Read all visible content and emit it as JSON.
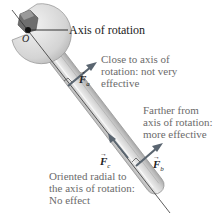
{
  "labels": {
    "axis": "Axis of rotation",
    "origin": "O",
    "close": [
      "Close to axis of",
      "rotation: not very",
      "effective"
    ],
    "farther": [
      "Farther from",
      "axis of rotation:",
      "more effective"
    ],
    "radial": [
      "Oriented radial to",
      "the axis of rotation:",
      "No effect"
    ]
  },
  "forces": {
    "a": {
      "symbol": "F",
      "sub": "a",
      "arrow": "→"
    },
    "b": {
      "symbol": "F",
      "sub": "b",
      "arrow": "→"
    },
    "c": {
      "symbol": "F",
      "sub": "c",
      "arrow": "→"
    }
  },
  "colors": {
    "wrench_light": "#e6e6e6",
    "wrench_mid": "#c8c8c8",
    "wrench_dark": "#9a9a9a",
    "arrow": "#5a6570",
    "line": "#333333",
    "text_gray": "#6b6b6b"
  }
}
